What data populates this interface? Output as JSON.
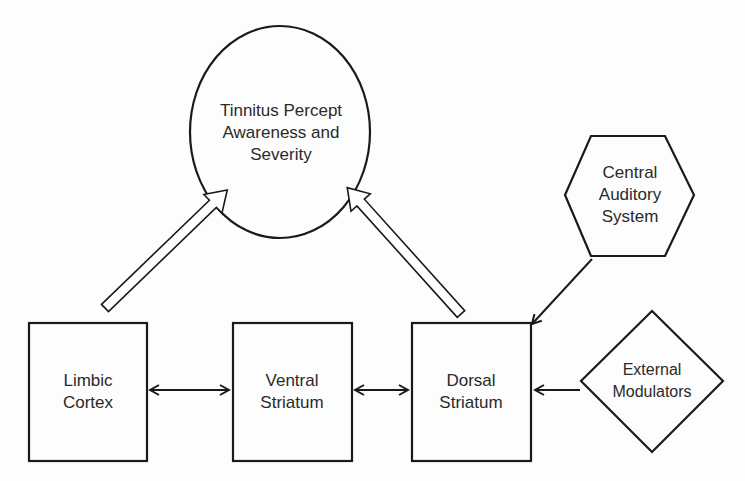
{
  "diagram": {
    "nodes": {
      "percept": {
        "shape": "ellipse",
        "label": "Tinnitus Percept\nAwareness and\nSeverity"
      },
      "central_auditory": {
        "shape": "hexagon",
        "label": "Central\nAuditory\nSystem"
      },
      "limbic": {
        "shape": "rectangle",
        "label": "Limbic\nCortex"
      },
      "ventral": {
        "shape": "rectangle",
        "label": "Ventral\nStriatum"
      },
      "dorsal": {
        "shape": "rectangle",
        "label": "Dorsal\nStriatum"
      },
      "external": {
        "shape": "diamond",
        "label": "External\nModulators"
      }
    },
    "edges": [
      {
        "from": "limbic",
        "to": "percept",
        "style": "hollow-block-arrow"
      },
      {
        "from": "dorsal",
        "to": "percept",
        "style": "hollow-block-arrow"
      },
      {
        "from": "limbic",
        "to": "ventral",
        "style": "bidirectional"
      },
      {
        "from": "ventral",
        "to": "dorsal",
        "style": "bidirectional"
      },
      {
        "from": "central_auditory",
        "to": "dorsal",
        "style": "line-arrow"
      },
      {
        "from": "external",
        "to": "dorsal",
        "style": "line-arrow"
      }
    ],
    "colors": {
      "stroke": "#1a1a1a",
      "text": "#2a2a2a",
      "background": "#fdfdfd"
    }
  }
}
